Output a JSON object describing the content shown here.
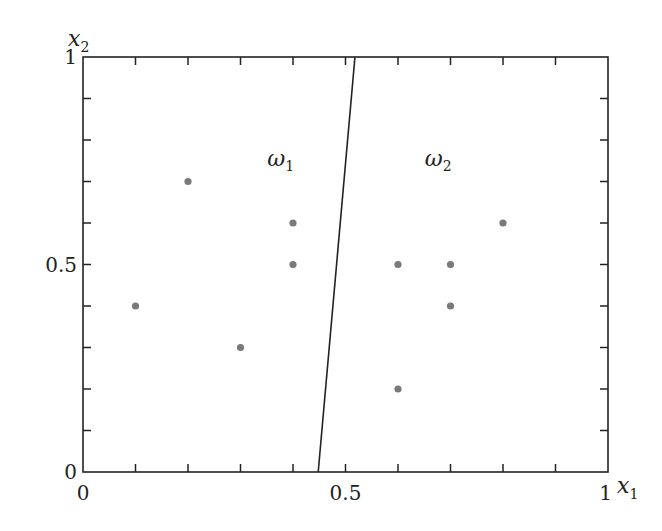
{
  "chart_data": {
    "type": "scatter",
    "title": "",
    "xlabel": "x",
    "xlabel_sub": "1",
    "ylabel": "x",
    "ylabel_sub": "2",
    "xlim": [
      0,
      1
    ],
    "ylim": [
      0,
      1
    ],
    "grid": false,
    "x_tick_labels": [
      {
        "value": 0,
        "label": "0"
      },
      {
        "value": 0.5,
        "label": "0.5"
      },
      {
        "value": 1,
        "label": "1"
      }
    ],
    "y_tick_labels": [
      {
        "value": 0,
        "label": "0"
      },
      {
        "value": 0.5,
        "label": "0.5"
      },
      {
        "value": 1,
        "label": "1"
      }
    ],
    "minor_tick_step": 0.1,
    "series": [
      {
        "name": "ω1",
        "points": [
          [
            0.1,
            0.4
          ],
          [
            0.2,
            0.7
          ],
          [
            0.3,
            0.3
          ],
          [
            0.4,
            0.6
          ],
          [
            0.4,
            0.5
          ]
        ]
      },
      {
        "name": "ω2",
        "points": [
          [
            0.6,
            0.5
          ],
          [
            0.6,
            0.2
          ],
          [
            0.7,
            0.5
          ],
          [
            0.7,
            0.4
          ],
          [
            0.8,
            0.6
          ]
        ]
      }
    ],
    "decision_boundary": {
      "from": [
        0.448,
        0
      ],
      "to": [
        0.518,
        1
      ]
    },
    "region_labels": [
      {
        "text": "ω",
        "sub": "1",
        "x": 0.37,
        "y": 0.75
      },
      {
        "text": "ω",
        "sub": "2",
        "x": 0.67,
        "y": 0.75
      }
    ],
    "colors": {
      "axis": "#222222",
      "point": "#7a7a7a",
      "boundary": "#222222"
    }
  }
}
